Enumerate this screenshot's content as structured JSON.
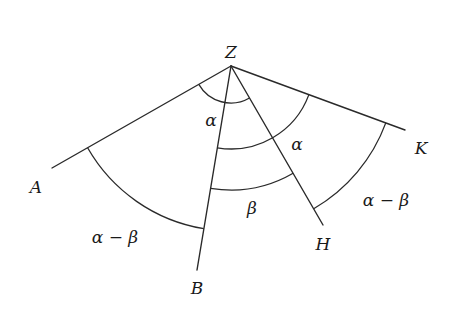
{
  "diagram": {
    "title": "",
    "apex": {
      "label": "Z",
      "x": 231,
      "y": 66,
      "label_x": 231,
      "label_y": 58
    },
    "rays": [
      {
        "id": "A",
        "label": "A",
        "end_x": 52,
        "end_y": 168,
        "label_x": 36,
        "label_y": 193
      },
      {
        "id": "B",
        "label": "B",
        "end_x": 197,
        "end_y": 270,
        "label_x": 197,
        "label_y": 294
      },
      {
        "id": "H",
        "label": "H",
        "end_x": 323,
        "end_y": 225,
        "label_x": 323,
        "label_y": 250
      },
      {
        "id": "K",
        "label": "K",
        "end_x": 405,
        "end_y": 130,
        "label_x": 421,
        "label_y": 154
      }
    ],
    "arcs": [
      {
        "id": "arc-1",
        "from": "A",
        "to": "H",
        "radius": 37,
        "label": "α",
        "label_x": 211,
        "label_y": 126
      },
      {
        "id": "arc-2",
        "from": "B",
        "to": "K",
        "radius": 83,
        "label": "α",
        "label_x": 297,
        "label_y": 150
      },
      {
        "id": "arc-3",
        "from": "B",
        "to": "H",
        "radius": 124,
        "label": "β",
        "label_x": 252,
        "label_y": 214
      },
      {
        "id": "arc-4",
        "from": "A",
        "to": "B",
        "radius": 165,
        "label": "α − β",
        "label_x": 115,
        "label_y": 243
      },
      {
        "id": "arc-5",
        "from": "H",
        "to": "K",
        "radius": 165,
        "label": "α − β",
        "label_x": 386,
        "label_y": 206
      }
    ]
  }
}
